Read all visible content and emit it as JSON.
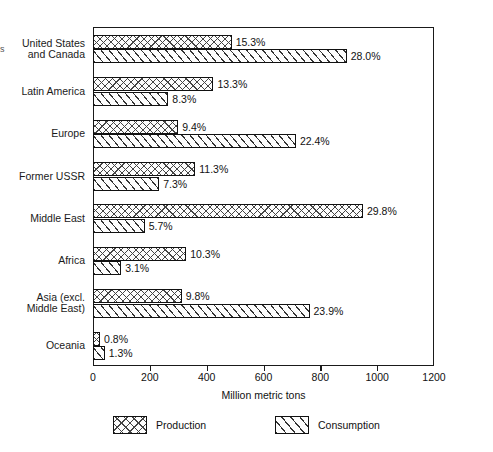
{
  "edge_artifact": "s",
  "chart_data": {
    "type": "bar",
    "orientation": "horizontal",
    "title": "",
    "xlabel": "Million metric tons",
    "ylabel": "",
    "xlim": [
      0,
      1200
    ],
    "xticks": [
      0,
      200,
      400,
      600,
      800,
      1000,
      1200
    ],
    "xtick_labels": [
      "0",
      "200",
      "400",
      "600",
      "800",
      "1000",
      "1200"
    ],
    "grid": false,
    "legend_position": "bottom",
    "categories": [
      "United States\nand Canada",
      "Latin America",
      "Europe",
      "Former USSR",
      "Middle East",
      "Africa",
      "Asia (excl.\nMiddle East)",
      "Oceania"
    ],
    "series": [
      {
        "name": "Production",
        "pattern": "cross-hatch",
        "values": [
          488,
          424,
          300,
          360,
          950,
          328,
          312,
          25
        ],
        "labels": [
          "15.3%",
          "13.3%",
          "9.4%",
          "11.3%",
          "29.8%",
          "10.3%",
          "9.8%",
          "0.8%"
        ]
      },
      {
        "name": "Consumption",
        "pattern": "diagonal-hatch",
        "values": [
          893,
          265,
          714,
          233,
          182,
          99,
          762,
          41
        ],
        "labels": [
          "28.0%",
          "8.3%",
          "22.4%",
          "7.3%",
          "5.7%",
          "3.1%",
          "23.9%",
          "1.3%"
        ]
      }
    ]
  },
  "legend": {
    "items": [
      {
        "label": "Production"
      },
      {
        "label": "Consumption"
      }
    ]
  },
  "colors": {
    "axis": "#1a1a1a",
    "bar_outline": "#111111",
    "hatch": "#444444",
    "background": "#ffffff"
  }
}
